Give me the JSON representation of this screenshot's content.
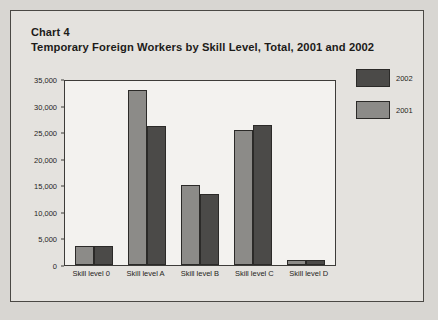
{
  "document": {
    "chart_number": "Chart 4",
    "title": "Temporary Foreign Workers by Skill Level, Total, 2001 and 2002"
  },
  "legend": {
    "position": "right",
    "entries": [
      {
        "label": "2002",
        "color": "#4b4a48"
      },
      {
        "label": "2001",
        "color": "#8c8b88"
      }
    ]
  },
  "axis": {
    "y_ticks": [
      "35,000",
      "30,000",
      "25,000",
      "20,000",
      "15,000",
      "10,000",
      "5,000",
      "0"
    ]
  },
  "chart_data": {
    "type": "bar",
    "title": "Temporary Foreign Workers by Skill Level, Total, 2001 and 2002",
    "xlabel": "",
    "ylabel": "",
    "ylim": [
      0,
      35000
    ],
    "ytick_values": [
      0,
      5000,
      10000,
      15000,
      20000,
      25000,
      30000,
      35000
    ],
    "grid": false,
    "legend_position": "right",
    "categories": [
      "Skill level 0",
      "Skill level A",
      "Skill level B",
      "Skill level C",
      "Skill level D"
    ],
    "series": [
      {
        "name": "2001",
        "color": "#8c8b88",
        "values": [
          3500,
          33000,
          15000,
          25400,
          900
        ]
      },
      {
        "name": "2002",
        "color": "#4b4a48",
        "values": [
          3500,
          26200,
          13300,
          26300,
          1000
        ]
      }
    ]
  }
}
